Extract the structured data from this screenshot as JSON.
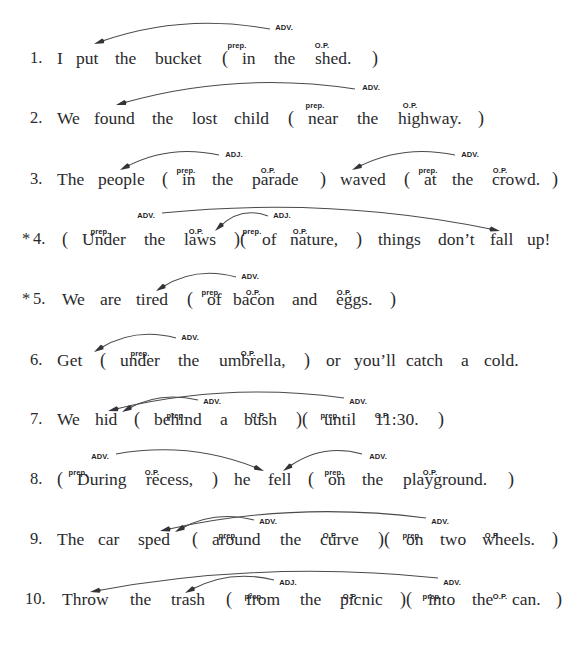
{
  "worksheet": {
    "kind": "prepositional-phrase-diagramming-exercise",
    "label_adv": "ADV.",
    "label_adj": "ADJ.",
    "label_prep": "prep.",
    "label_op": "O.P.",
    "open_paren": "(",
    "close_paren": ")",
    "close_open_paren": ")(",
    "asterisk": "*",
    "ink_color": "#2a2a2c",
    "arc_color": "#4a4a4e"
  },
  "sentences": [
    {
      "number": "1.",
      "starred": false,
      "baseline_y": 64,
      "tokens": [
        {
          "text": "1.",
          "x": 30,
          "kind": "num"
        },
        {
          "text": "I",
          "x": 57,
          "kind": "word"
        },
        {
          "text": "put",
          "x": 76,
          "kind": "word"
        },
        {
          "text": "the",
          "x": 115,
          "kind": "word"
        },
        {
          "text": "bucket",
          "x": 155,
          "kind": "word"
        },
        {
          "text": "(",
          "x": 222,
          "kind": "paren"
        },
        {
          "text": "in",
          "x": 242,
          "kind": "word"
        },
        {
          "text": "the",
          "x": 274,
          "kind": "word"
        },
        {
          "text": "shed.",
          "x": 315,
          "kind": "word"
        },
        {
          "text": ")",
          "x": 372,
          "kind": "paren"
        }
      ],
      "labels": [
        {
          "text": "ADV.",
          "x": 284,
          "y": 23
        },
        {
          "text": "prep.",
          "x": 237,
          "y": 41
        },
        {
          "text": "O.P.",
          "x": 322,
          "y": 41
        }
      ],
      "arcs": [
        {
          "from_x": 270,
          "from_y": 29,
          "to_x": 94,
          "to_y": 44,
          "bow": 16,
          "dir": "left"
        }
      ]
    },
    {
      "number": "2.",
      "starred": false,
      "baseline_y": 124,
      "tokens": [
        {
          "text": "2.",
          "x": 30,
          "kind": "num"
        },
        {
          "text": "We",
          "x": 57,
          "kind": "word"
        },
        {
          "text": "found",
          "x": 94,
          "kind": "word"
        },
        {
          "text": "the",
          "x": 152,
          "kind": "word"
        },
        {
          "text": "lost",
          "x": 192,
          "kind": "word"
        },
        {
          "text": "child",
          "x": 234,
          "kind": "word"
        },
        {
          "text": "(",
          "x": 288,
          "kind": "paren"
        },
        {
          "text": "near",
          "x": 308,
          "kind": "word"
        },
        {
          "text": "the",
          "x": 357,
          "kind": "word"
        },
        {
          "text": "highway.",
          "x": 398,
          "kind": "word"
        },
        {
          "text": ")",
          "x": 478,
          "kind": "paren"
        }
      ],
      "labels": [
        {
          "text": "ADV.",
          "x": 371,
          "y": 83
        },
        {
          "text": "prep.",
          "x": 315,
          "y": 101
        },
        {
          "text": "O.P.",
          "x": 410,
          "y": 101
        }
      ],
      "arcs": [
        {
          "from_x": 355,
          "from_y": 89,
          "to_x": 116,
          "to_y": 105,
          "bow": 18,
          "dir": "left"
        }
      ]
    },
    {
      "number": "3.",
      "starred": false,
      "baseline_y": 185,
      "tokens": [
        {
          "text": "3.",
          "x": 30,
          "kind": "num"
        },
        {
          "text": "The",
          "x": 57,
          "kind": "word"
        },
        {
          "text": "people",
          "x": 98,
          "kind": "word"
        },
        {
          "text": "(",
          "x": 162,
          "kind": "paren"
        },
        {
          "text": "in",
          "x": 182,
          "kind": "word"
        },
        {
          "text": "the",
          "x": 212,
          "kind": "word"
        },
        {
          "text": "parade",
          "x": 252,
          "kind": "word"
        },
        {
          "text": ")",
          "x": 320,
          "kind": "paren"
        },
        {
          "text": "waved",
          "x": 340,
          "kind": "word"
        },
        {
          "text": "(",
          "x": 404,
          "kind": "paren"
        },
        {
          "text": "at",
          "x": 424,
          "kind": "word"
        },
        {
          "text": "the",
          "x": 452,
          "kind": "word"
        },
        {
          "text": "crowd.",
          "x": 492,
          "kind": "word"
        },
        {
          "text": ")",
          "x": 552,
          "kind": "paren"
        }
      ],
      "labels": [
        {
          "text": "ADJ.",
          "x": 234,
          "y": 150
        },
        {
          "text": "prep.",
          "x": 186,
          "y": 166
        },
        {
          "text": "O.P.",
          "x": 268,
          "y": 166
        },
        {
          "text": "ADV.",
          "x": 470,
          "y": 150
        },
        {
          "text": "prep.",
          "x": 428,
          "y": 166
        },
        {
          "text": "O.P.",
          "x": 500,
          "y": 166
        }
      ],
      "arcs": [
        {
          "from_x": 219,
          "from_y": 155,
          "to_x": 120,
          "to_y": 170,
          "bow": 11,
          "dir": "left"
        },
        {
          "from_x": 455,
          "from_y": 155,
          "to_x": 352,
          "to_y": 170,
          "bow": 11,
          "dir": "left"
        }
      ]
    },
    {
      "number": "4.",
      "starred": true,
      "baseline_y": 245,
      "tokens": [
        {
          "text": "*",
          "x": 22,
          "kind": "star"
        },
        {
          "text": "4.",
          "x": 33,
          "kind": "num"
        },
        {
          "text": "(",
          "x": 62,
          "kind": "paren"
        },
        {
          "text": "Under",
          "x": 82,
          "kind": "word"
        },
        {
          "text": "the",
          "x": 144,
          "kind": "word"
        },
        {
          "text": "laws",
          "x": 184,
          "kind": "word"
        },
        {
          "text": ")(",
          "x": 234,
          "kind": "paren"
        },
        {
          "text": "of",
          "x": 262,
          "kind": "word"
        },
        {
          "text": "nature,",
          "x": 290,
          "kind": "word"
        },
        {
          "text": ")",
          "x": 356,
          "kind": "paren"
        },
        {
          "text": "things",
          "x": 378,
          "kind": "word"
        },
        {
          "text": "don’t",
          "x": 438,
          "kind": "word"
        },
        {
          "text": "fall",
          "x": 490,
          "kind": "word"
        },
        {
          "text": "up!",
          "x": 527,
          "kind": "word"
        }
      ],
      "labels": [
        {
          "text": "ADV.",
          "x": 146,
          "y": 211
        },
        {
          "text": "prep.",
          "x": 100,
          "y": 227
        },
        {
          "text": "O.P.",
          "x": 196,
          "y": 227
        },
        {
          "text": "ADJ.",
          "x": 282,
          "y": 211
        },
        {
          "text": "prep.",
          "x": 252,
          "y": 227
        },
        {
          "text": "O.P.",
          "x": 300,
          "y": 227
        }
      ],
      "arcs": [
        {
          "from_x": 162,
          "from_y": 213,
          "to_x": 500,
          "to_y": 231,
          "bow": 17,
          "dir": "right"
        },
        {
          "from_x": 268,
          "from_y": 216,
          "to_x": 215,
          "to_y": 231,
          "bow": 10,
          "dir": "left"
        }
      ]
    },
    {
      "number": "5.",
      "starred": true,
      "baseline_y": 305,
      "tokens": [
        {
          "text": "*",
          "x": 22,
          "kind": "star"
        },
        {
          "text": "5.",
          "x": 33,
          "kind": "num"
        },
        {
          "text": "We",
          "x": 62,
          "kind": "word"
        },
        {
          "text": "are",
          "x": 100,
          "kind": "word"
        },
        {
          "text": "tired",
          "x": 136,
          "kind": "word"
        },
        {
          "text": "(",
          "x": 187,
          "kind": "paren"
        },
        {
          "text": "of",
          "x": 207,
          "kind": "word"
        },
        {
          "text": "bacon",
          "x": 233,
          "kind": "word"
        },
        {
          "text": "and",
          "x": 292,
          "kind": "word"
        },
        {
          "text": "eggs.",
          "x": 336,
          "kind": "word"
        },
        {
          "text": ")",
          "x": 390,
          "kind": "paren"
        }
      ],
      "labels": [
        {
          "text": "ADV.",
          "x": 250,
          "y": 272
        },
        {
          "text": "prep.",
          "x": 211,
          "y": 288
        },
        {
          "text": "O.P.",
          "x": 253,
          "y": 288
        },
        {
          "text": "O.P.",
          "x": 344,
          "y": 288
        }
      ],
      "arcs": [
        {
          "from_x": 236,
          "from_y": 277,
          "to_x": 156,
          "to_y": 291,
          "bow": 11,
          "dir": "left"
        }
      ]
    },
    {
      "number": "6.",
      "starred": false,
      "baseline_y": 366,
      "tokens": [
        {
          "text": "6.",
          "x": 30,
          "kind": "num"
        },
        {
          "text": "Get",
          "x": 57,
          "kind": "word"
        },
        {
          "text": "(",
          "x": 100,
          "kind": "paren"
        },
        {
          "text": "under",
          "x": 120,
          "kind": "word"
        },
        {
          "text": "the",
          "x": 178,
          "kind": "word"
        },
        {
          "text": "umbrella,",
          "x": 219,
          "kind": "word"
        },
        {
          "text": ")",
          "x": 304,
          "kind": "paren"
        },
        {
          "text": "or",
          "x": 326,
          "kind": "word"
        },
        {
          "text": "you’ll",
          "x": 354,
          "kind": "word"
        },
        {
          "text": "catch",
          "x": 406,
          "kind": "word"
        },
        {
          "text": "a",
          "x": 461,
          "kind": "word"
        },
        {
          "text": "cold.",
          "x": 484,
          "kind": "word"
        }
      ],
      "labels": [
        {
          "text": "ADV.",
          "x": 190,
          "y": 333
        },
        {
          "text": "prep.",
          "x": 140,
          "y": 349
        },
        {
          "text": "O.P.",
          "x": 248,
          "y": 349
        }
      ],
      "arcs": [
        {
          "from_x": 176,
          "from_y": 338,
          "to_x": 94,
          "to_y": 352,
          "bow": 11,
          "dir": "left"
        }
      ]
    },
    {
      "number": "7.",
      "starred": false,
      "baseline_y": 425,
      "tokens": [
        {
          "text": "7.",
          "x": 30,
          "kind": "num"
        },
        {
          "text": "We",
          "x": 57,
          "kind": "word"
        },
        {
          "text": "hid",
          "x": 95,
          "kind": "word"
        },
        {
          "text": "(",
          "x": 134,
          "kind": "paren"
        },
        {
          "text": "behind",
          "x": 154,
          "kind": "word"
        },
        {
          "text": "a",
          "x": 220,
          "kind": "word"
        },
        {
          "text": "bush",
          "x": 244,
          "kind": "word"
        },
        {
          "text": ")(",
          "x": 296,
          "kind": "paren"
        },
        {
          "text": "until",
          "x": 324,
          "kind": "word"
        },
        {
          "text": "11:30.",
          "x": 375,
          "kind": "word"
        },
        {
          "text": ")",
          "x": 438,
          "kind": "paren"
        }
      ],
      "labels": [
        {
          "text": "ADV.",
          "x": 212,
          "y": 397
        },
        {
          "text": "prep.",
          "x": 176,
          "y": 411
        },
        {
          "text": "O.P.",
          "x": 258,
          "y": 411
        },
        {
          "text": "ADV.",
          "x": 358,
          "y": 397
        },
        {
          "text": "prep.",
          "x": 330,
          "y": 411
        },
        {
          "text": "O.P.",
          "x": 382,
          "y": 411
        }
      ],
      "arcs": [
        {
          "from_x": 344,
          "from_y": 398,
          "to_x": 108,
          "to_y": 411,
          "bow": 16,
          "dir": "left"
        },
        {
          "from_x": 198,
          "from_y": 400,
          "to_x": 122,
          "to_y": 412,
          "bow": 9,
          "dir": "left"
        }
      ]
    },
    {
      "number": "8.",
      "starred": false,
      "baseline_y": 485,
      "tokens": [
        {
          "text": "8.",
          "x": 30,
          "kind": "num"
        },
        {
          "text": "(",
          "x": 57,
          "kind": "paren"
        },
        {
          "text": "During",
          "x": 77,
          "kind": "word"
        },
        {
          "text": "recess,",
          "x": 146,
          "kind": "word"
        },
        {
          "text": ")",
          "x": 212,
          "kind": "paren"
        },
        {
          "text": "he",
          "x": 234,
          "kind": "word"
        },
        {
          "text": "fell",
          "x": 268,
          "kind": "word"
        },
        {
          "text": "(",
          "x": 308,
          "kind": "paren"
        },
        {
          "text": "on",
          "x": 328,
          "kind": "word"
        },
        {
          "text": "the",
          "x": 362,
          "kind": "word"
        },
        {
          "text": "playground.",
          "x": 403,
          "kind": "word"
        },
        {
          "text": ")",
          "x": 508,
          "kind": "paren"
        }
      ],
      "labels": [
        {
          "text": "ADV.",
          "x": 100,
          "y": 452
        },
        {
          "text": "prep.",
          "x": 78,
          "y": 468
        },
        {
          "text": "O.P.",
          "x": 152,
          "y": 468
        },
        {
          "text": "ADV.",
          "x": 378,
          "y": 452
        },
        {
          "text": "prep.",
          "x": 334,
          "y": 468
        },
        {
          "text": "O.P.",
          "x": 430,
          "y": 468
        }
      ],
      "arcs": [
        {
          "from_x": 116,
          "from_y": 454,
          "to_x": 264,
          "to_y": 471,
          "bow": 13,
          "dir": "right"
        },
        {
          "from_x": 362,
          "from_y": 454,
          "to_x": 283,
          "to_y": 471,
          "bow": 11,
          "dir": "left"
        }
      ]
    },
    {
      "number": "9.",
      "starred": false,
      "baseline_y": 545,
      "tokens": [
        {
          "text": "9.",
          "x": 30,
          "kind": "num"
        },
        {
          "text": "The",
          "x": 57,
          "kind": "word"
        },
        {
          "text": "car",
          "x": 98,
          "kind": "word"
        },
        {
          "text": "sped",
          "x": 138,
          "kind": "word"
        },
        {
          "text": "(",
          "x": 192,
          "kind": "paren"
        },
        {
          "text": "around",
          "x": 212,
          "kind": "word"
        },
        {
          "text": "the",
          "x": 280,
          "kind": "word"
        },
        {
          "text": "curve",
          "x": 320,
          "kind": "word"
        },
        {
          "text": ")(",
          "x": 378,
          "kind": "paren"
        },
        {
          "text": "on",
          "x": 406,
          "kind": "word"
        },
        {
          "text": "two",
          "x": 440,
          "kind": "word"
        },
        {
          "text": "wheels.",
          "x": 482,
          "kind": "word"
        },
        {
          "text": ")",
          "x": 552,
          "kind": "paren"
        }
      ],
      "labels": [
        {
          "text": "ADV.",
          "x": 268,
          "y": 517
        },
        {
          "text": "prep.",
          "x": 228,
          "y": 531
        },
        {
          "text": "O.P.",
          "x": 330,
          "y": 531
        },
        {
          "text": "ADV.",
          "x": 440,
          "y": 517
        },
        {
          "text": "prep.",
          "x": 412,
          "y": 531
        },
        {
          "text": "O.P.",
          "x": 492,
          "y": 531
        }
      ],
      "arcs": [
        {
          "from_x": 426,
          "from_y": 518,
          "to_x": 160,
          "to_y": 531,
          "bow": 17,
          "dir": "left"
        },
        {
          "from_x": 254,
          "from_y": 520,
          "to_x": 175,
          "to_y": 532,
          "bow": 10,
          "dir": "left"
        }
      ]
    },
    {
      "number": "10.",
      "starred": false,
      "baseline_y": 605,
      "tokens": [
        {
          "text": "10.",
          "x": 25,
          "kind": "num"
        },
        {
          "text": "Throw",
          "x": 62,
          "kind": "word"
        },
        {
          "text": "the",
          "x": 130,
          "kind": "word"
        },
        {
          "text": "trash",
          "x": 171,
          "kind": "word"
        },
        {
          "text": "(",
          "x": 226,
          "kind": "paren"
        },
        {
          "text": "from",
          "x": 246,
          "kind": "word"
        },
        {
          "text": "the",
          "x": 300,
          "kind": "word"
        },
        {
          "text": "picnic",
          "x": 340,
          "kind": "word"
        },
        {
          "text": ")(",
          "x": 400,
          "kind": "paren"
        },
        {
          "text": "into",
          "x": 428,
          "kind": "word"
        },
        {
          "text": "the",
          "x": 472,
          "kind": "word"
        },
        {
          "text": "can.",
          "x": 512,
          "kind": "word"
        },
        {
          "text": ")",
          "x": 556,
          "kind": "paren"
        }
      ],
      "labels": [
        {
          "text": "ADJ.",
          "x": 288,
          "y": 578
        },
        {
          "text": "prep.",
          "x": 254,
          "y": 592
        },
        {
          "text": "O.P.",
          "x": 350,
          "y": 592
        },
        {
          "text": "ADV.",
          "x": 452,
          "y": 578
        },
        {
          "text": "prep.",
          "x": 432,
          "y": 592
        },
        {
          "text": "O.P.",
          "x": 500,
          "y": 592
        }
      ],
      "arcs": [
        {
          "from_x": 438,
          "from_y": 578,
          "to_x": 90,
          "to_y": 592,
          "bow": 18,
          "dir": "left"
        },
        {
          "from_x": 274,
          "from_y": 580,
          "to_x": 185,
          "to_y": 593,
          "bow": 11,
          "dir": "left"
        }
      ]
    }
  ]
}
